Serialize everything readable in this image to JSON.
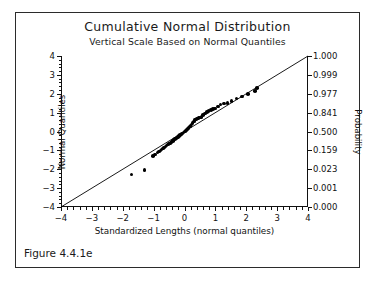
{
  "figure": {
    "caption": "Figure 4.4.1e"
  },
  "chart_data": {
    "type": "scatter",
    "title": "Cumulative Normal Distribution",
    "subtitle": "Vertical Scale Based on Normal Quantiles",
    "xlabel": "Standardized Lengths (normal quantiles)",
    "ylabel": "Normal Quantiles",
    "y2label": "Probability",
    "xlim": [
      -4,
      4
    ],
    "ylim": [
      -4,
      4
    ],
    "grid": false,
    "legend": null,
    "xticks": [
      -4,
      -3,
      -2,
      -1,
      0,
      1,
      2,
      3,
      4
    ],
    "xticklabels": [
      "−4",
      "−3",
      "−2",
      "−1",
      "0",
      "1",
      "2",
      "3",
      "4"
    ],
    "xminor_step": 0.2,
    "yticks": [
      -4,
      -3,
      -2,
      -1,
      0,
      1,
      2,
      3,
      4
    ],
    "yticklabels": [
      "−4",
      "−3",
      "−2",
      "−1",
      "0",
      "1",
      "2",
      "3",
      "4"
    ],
    "yminor_step": 0.2,
    "y2ticks": [
      -4,
      -3,
      -2,
      -1,
      0,
      1,
      2,
      3,
      4
    ],
    "y2ticklabels": [
      "0.000",
      "0.001",
      "0.023",
      "0.159",
      "0.500",
      "0.841",
      "0.977",
      "0.999",
      "1.000"
    ],
    "reference_line": {
      "label": "identity line",
      "from": [
        -4,
        -4
      ],
      "to": [
        4,
        4
      ],
      "color": "#000000"
    },
    "marker_color": "#000000",
    "points": [
      [
        -1.72,
        -2.27
      ],
      [
        -1.3,
        -2.05
      ],
      [
        -1.02,
        -1.3
      ],
      [
        -0.95,
        -1.22
      ],
      [
        -0.88,
        -1.12
      ],
      [
        -0.83,
        -1.05
      ],
      [
        -0.78,
        -1.0
      ],
      [
        -0.74,
        -0.95
      ],
      [
        -0.7,
        -0.9
      ],
      [
        -0.66,
        -0.84
      ],
      [
        -0.62,
        -0.8
      ],
      [
        -0.58,
        -0.74
      ],
      [
        -0.54,
        -0.69
      ],
      [
        -0.5,
        -0.64
      ],
      [
        -0.46,
        -0.6
      ],
      [
        -0.42,
        -0.55
      ],
      [
        -0.38,
        -0.5
      ],
      [
        -0.35,
        -0.46
      ],
      [
        -0.31,
        -0.41
      ],
      [
        -0.28,
        -0.37
      ],
      [
        -0.24,
        -0.32
      ],
      [
        -0.21,
        -0.28
      ],
      [
        -0.17,
        -0.23
      ],
      [
        -0.14,
        -0.19
      ],
      [
        -0.1,
        -0.14
      ],
      [
        -0.07,
        -0.1
      ],
      [
        -0.03,
        -0.05
      ],
      [
        0.0,
        -0.01
      ],
      [
        0.03,
        0.04
      ],
      [
        0.07,
        0.09
      ],
      [
        0.1,
        0.14
      ],
      [
        0.13,
        0.2
      ],
      [
        0.17,
        0.26
      ],
      [
        0.2,
        0.32
      ],
      [
        0.23,
        0.38
      ],
      [
        0.26,
        0.46
      ],
      [
        0.3,
        0.54
      ],
      [
        0.33,
        0.6
      ],
      [
        0.37,
        0.64
      ],
      [
        0.41,
        0.69
      ],
      [
        0.45,
        0.72
      ],
      [
        0.5,
        0.74
      ],
      [
        0.55,
        0.78
      ],
      [
        0.6,
        0.86
      ],
      [
        0.66,
        0.95
      ],
      [
        0.72,
        1.02
      ],
      [
        0.78,
        1.08
      ],
      [
        0.85,
        1.13
      ],
      [
        0.92,
        1.18
      ],
      [
        0.99,
        1.22
      ],
      [
        1.08,
        1.32
      ],
      [
        1.17,
        1.44
      ],
      [
        1.27,
        1.48
      ],
      [
        1.39,
        1.52
      ],
      [
        1.52,
        1.62
      ],
      [
        1.68,
        1.74
      ],
      [
        1.86,
        1.86
      ],
      [
        2.06,
        1.98
      ],
      [
        2.28,
        2.14
      ],
      [
        2.34,
        2.3
      ]
    ]
  }
}
